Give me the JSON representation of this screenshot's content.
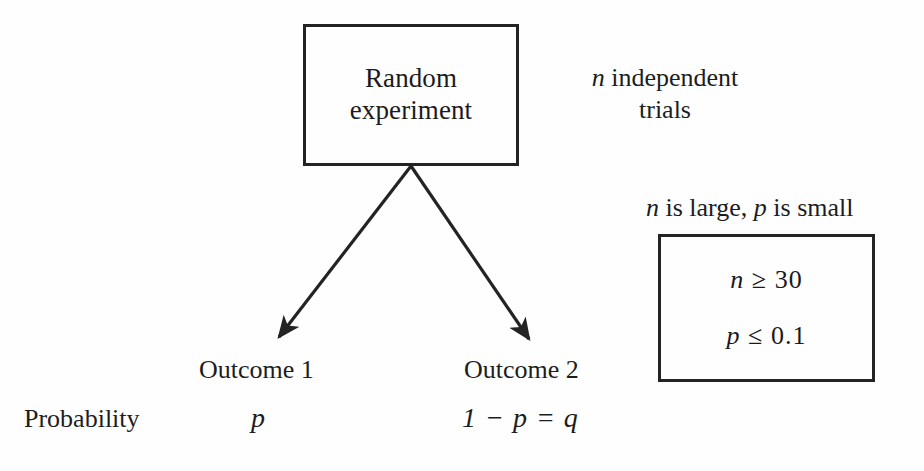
{
  "diagram": {
    "background_color": "#fefefe",
    "ink_color": "#1d1d1d",
    "experiment_box": {
      "line1": "Random",
      "line2": "experiment"
    },
    "trials_note": "n independent trials",
    "trials_note_parts": {
      "symbol": "n",
      "text": " independent trials"
    },
    "assumption_note": "n is large, p is small",
    "assumption_note_parts": {
      "symbol1": "n",
      "text1": " is large, ",
      "symbol2": "p",
      "text2": " is small"
    },
    "conditions": [
      {
        "symbol": "n",
        "relation": "≥",
        "value": "30"
      },
      {
        "symbol": "p",
        "relation": "≤",
        "value": "0.1"
      }
    ],
    "branches": [
      {
        "label": "Outcome 1",
        "probability": "p",
        "probability_plain": "p"
      },
      {
        "label": "Outcome 2",
        "probability": "1 − p = q",
        "probability_plain": "1 - p = q"
      }
    ],
    "row_label": "Probability",
    "arrows": [
      {
        "name": "arrow-to-outcome-1",
        "from": [
          411,
          166
        ],
        "to": [
          273,
          344
        ]
      },
      {
        "name": "arrow-to-outcome-2",
        "from": [
          411,
          166
        ],
        "to": [
          535,
          346
        ]
      }
    ]
  }
}
